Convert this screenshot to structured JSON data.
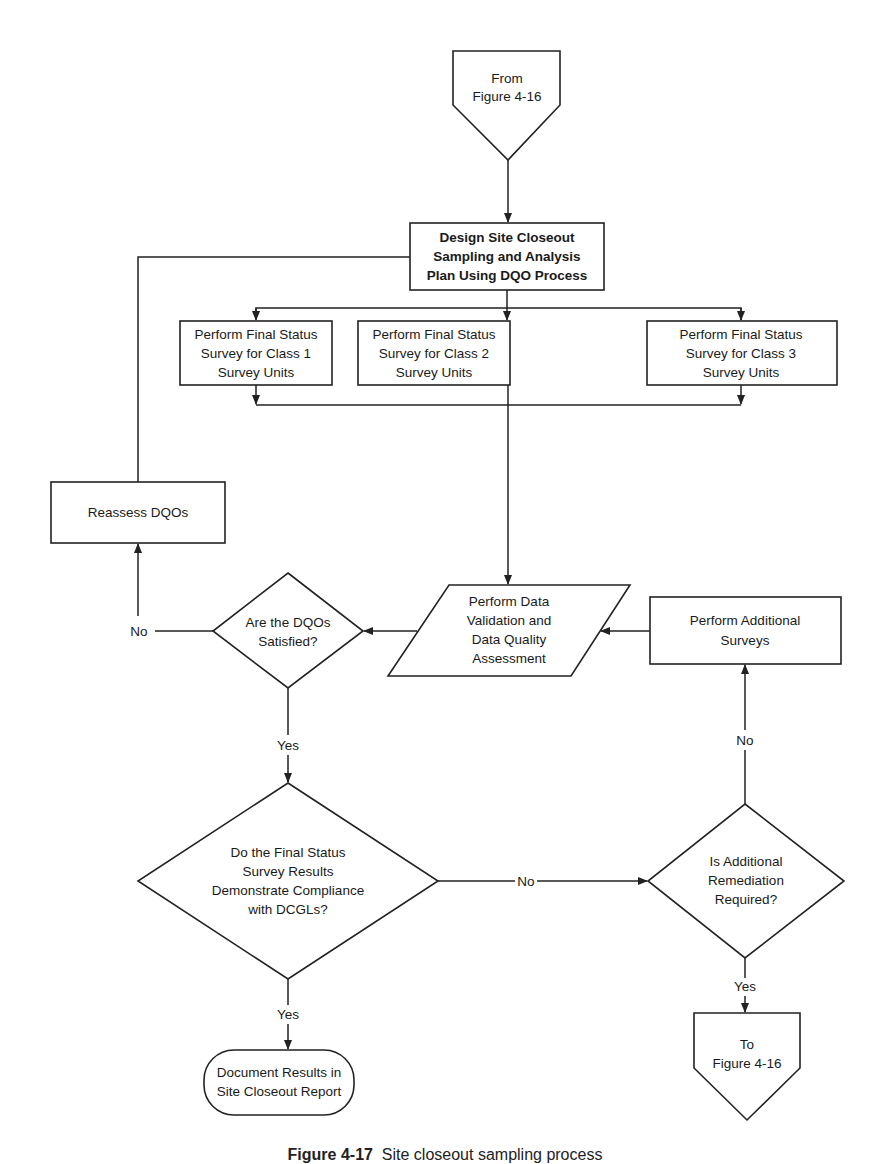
{
  "diagram": {
    "nodes": {
      "from_connector": {
        "lines": [
          "From",
          "Figure 4-16"
        ],
        "shape": "off-page-connector"
      },
      "design_plan": {
        "lines": [
          "Design Site Closeout",
          "Sampling and Analysis",
          "Plan Using DQO Process"
        ],
        "shape": "process"
      },
      "class1": {
        "lines": [
          "Perform Final Status",
          "Survey for Class 1",
          "Survey Units"
        ],
        "shape": "process"
      },
      "class2": {
        "lines": [
          "Perform Final Status",
          "Survey for Class 2",
          "Survey Units"
        ],
        "shape": "process"
      },
      "class3": {
        "lines": [
          "Perform Final Status",
          "Survey for Class 3",
          "Survey Units"
        ],
        "shape": "process"
      },
      "reassess": {
        "lines": [
          "Reassess DQOs"
        ],
        "shape": "process"
      },
      "dqo_decision": {
        "lines": [
          "Are the DQOs",
          "Satisfied?"
        ],
        "shape": "decision"
      },
      "validation": {
        "lines": [
          "Perform Data",
          "Validation and",
          "Data Quality",
          "Assessment"
        ],
        "shape": "data"
      },
      "additional_surveys": {
        "lines": [
          "Perform Additional",
          "Surveys"
        ],
        "shape": "process"
      },
      "compliance_decision": {
        "lines": [
          "Do the Final Status",
          "Survey Results",
          "Demonstrate Compliance",
          "with DCGLs?"
        ],
        "shape": "decision"
      },
      "remediation_decision": {
        "lines": [
          "Is Additional",
          "Remediation",
          "Required?"
        ],
        "shape": "decision"
      },
      "document_results": {
        "lines": [
          "Document Results in",
          "Site Closeout Report"
        ],
        "shape": "terminator"
      },
      "to_connector": {
        "lines": [
          "To",
          "Figure 4-16"
        ],
        "shape": "off-page-connector"
      }
    },
    "edge_labels": {
      "dqo_no": "No",
      "dqo_yes": "Yes",
      "compliance_no": "No",
      "compliance_yes": "Yes",
      "remediation_no": "No",
      "remediation_yes": "Yes"
    },
    "edges": [
      {
        "from": "from_connector",
        "to": "design_plan"
      },
      {
        "from": "design_plan",
        "to": "class1"
      },
      {
        "from": "design_plan",
        "to": "class2"
      },
      {
        "from": "design_plan",
        "to": "class3"
      },
      {
        "from": "class1",
        "to": "validation"
      },
      {
        "from": "class2",
        "to": "validation"
      },
      {
        "from": "class3",
        "to": "validation"
      },
      {
        "from": "validation",
        "to": "dqo_decision"
      },
      {
        "from": "dqo_decision",
        "to": "reassess",
        "label": "No"
      },
      {
        "from": "reassess",
        "to": "design_plan"
      },
      {
        "from": "dqo_decision",
        "to": "compliance_decision",
        "label": "Yes"
      },
      {
        "from": "compliance_decision",
        "to": "remediation_decision",
        "label": "No"
      },
      {
        "from": "compliance_decision",
        "to": "document_results",
        "label": "Yes"
      },
      {
        "from": "remediation_decision",
        "to": "additional_surveys",
        "label": "No"
      },
      {
        "from": "remediation_decision",
        "to": "to_connector",
        "label": "Yes"
      },
      {
        "from": "additional_surveys",
        "to": "validation"
      }
    ]
  },
  "caption": {
    "figure": "Figure 4-17",
    "text": "Site closeout sampling process"
  }
}
